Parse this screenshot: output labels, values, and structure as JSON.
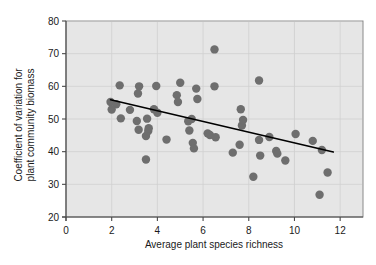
{
  "chart_data": {
    "type": "scatter",
    "title": "",
    "xlabel": "Average plant species richness",
    "ylabel": "Coefficient of variation for plant community biomass",
    "ylabel_line1": "Coefficient of variation for",
    "ylabel_line2": "plant community biomass",
    "xlim": [
      0,
      13
    ],
    "ylim": [
      20,
      80
    ],
    "xticks": [
      0,
      2,
      4,
      6,
      8,
      10,
      12
    ],
    "xticklabels": [
      "0",
      "2",
      "4",
      "6",
      "8",
      "10",
      "12"
    ],
    "yticks": [
      20,
      30,
      40,
      50,
      60,
      70,
      80
    ],
    "yticklabels": [
      "20",
      "30",
      "40",
      "50",
      "60",
      "70",
      "80"
    ],
    "grid": true,
    "grid_axis": "both",
    "legend": "none",
    "plot_bgcolor": "#e6e6e6",
    "point_color": "#6e6e6e",
    "line_color": "#000000",
    "marker_size": 4.2,
    "points": [
      [
        1.95,
        55.2
      ],
      [
        2.2,
        54.5
      ],
      [
        2.35,
        60.3
      ],
      [
        2.0,
        52.9
      ],
      [
        2.4,
        50.2
      ],
      [
        2.8,
        52.8
      ],
      [
        3.1,
        49.4
      ],
      [
        3.15,
        57.8
      ],
      [
        3.2,
        60.0
      ],
      [
        3.18,
        46.7
      ],
      [
        3.5,
        37.6
      ],
      [
        3.55,
        50.1
      ],
      [
        3.5,
        44.8
      ],
      [
        3.6,
        46.3
      ],
      [
        3.62,
        47.2
      ],
      [
        3.85,
        53.0
      ],
      [
        3.95,
        60.1
      ],
      [
        4.0,
        51.9
      ],
      [
        4.4,
        43.7
      ],
      [
        4.85,
        57.3
      ],
      [
        4.9,
        55.2
      ],
      [
        5.0,
        61.1
      ],
      [
        5.35,
        49.3
      ],
      [
        5.4,
        46.5
      ],
      [
        5.5,
        50.0
      ],
      [
        5.55,
        42.7
      ],
      [
        5.6,
        41.0
      ],
      [
        5.7,
        59.3
      ],
      [
        5.75,
        56.1
      ],
      [
        6.2,
        45.6
      ],
      [
        6.3,
        45.1
      ],
      [
        6.5,
        71.3
      ],
      [
        6.5,
        60.0
      ],
      [
        6.55,
        44.4
      ],
      [
        7.3,
        39.7
      ],
      [
        7.6,
        42.1
      ],
      [
        7.65,
        53.0
      ],
      [
        7.7,
        48.0
      ],
      [
        7.75,
        49.7
      ],
      [
        8.2,
        32.3
      ],
      [
        8.45,
        61.8
      ],
      [
        8.45,
        43.6
      ],
      [
        8.5,
        38.8
      ],
      [
        8.9,
        44.5
      ],
      [
        9.2,
        40.2
      ],
      [
        9.25,
        39.4
      ],
      [
        9.6,
        37.3
      ],
      [
        10.05,
        45.4
      ],
      [
        10.8,
        43.3
      ],
      [
        11.1,
        26.8
      ],
      [
        11.2,
        40.5
      ],
      [
        11.45,
        33.6
      ]
    ],
    "trendline": {
      "x_start": 1.95,
      "y_start": 55.9,
      "x_end": 11.7,
      "y_end": 39.9
    }
  }
}
